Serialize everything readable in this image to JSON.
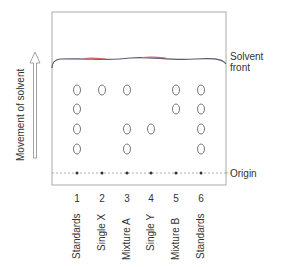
{
  "diagram": {
    "type": "paper-chromatography",
    "axis_label": "Movement of solvent",
    "solvent_front_label_line1": "Solvent",
    "solvent_front_label_line2": "front",
    "origin_label": "Origin",
    "lanes": [
      {
        "number": "1",
        "label": "Standards",
        "spots": 4
      },
      {
        "number": "2",
        "label": "Single X",
        "spots": 1
      },
      {
        "number": "3",
        "label": "Mixture A",
        "spots": 3
      },
      {
        "number": "4",
        "label": "Single Y",
        "spots": 1
      },
      {
        "number": "5",
        "label": "Mixture B",
        "spots": 2
      },
      {
        "number": "6",
        "label": "Standards",
        "spots": 4
      }
    ],
    "spot_rows": {
      "lane1": [
        1,
        2,
        3,
        4
      ],
      "lane2": [
        1
      ],
      "lane3": [
        1,
        3,
        4
      ],
      "lane4": [
        3
      ],
      "lane5": [
        1,
        2
      ],
      "lane6": [
        1,
        2,
        3,
        4
      ]
    },
    "colors": {
      "frame": "#aaaaaa",
      "solvent_front": "#555b6e",
      "solvent_front_accent": "#d9636f",
      "spot_outline": "#666666",
      "origin_line": "#999999",
      "text": "#333333",
      "arrow": "#999999"
    }
  }
}
